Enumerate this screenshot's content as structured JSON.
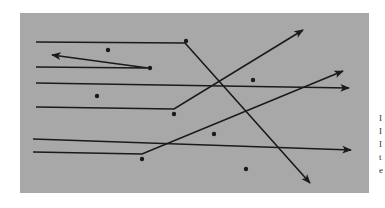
{
  "diagram": {
    "type": "trajectory-diagram",
    "panel": {
      "x": 20,
      "y": 13,
      "width": 349,
      "height": 180,
      "fill": "#a8a8a8"
    },
    "stroke_color": "#1a1a1a",
    "paths": [
      {
        "id": "path-a",
        "points": [
          [
            36,
            42
          ],
          [
            185,
            43
          ],
          [
            310,
            183
          ]
        ],
        "arrow_end": true
      },
      {
        "id": "path-b",
        "points": [
          [
            36,
            67
          ],
          [
            148,
            68
          ],
          [
            52,
            55
          ]
        ],
        "arrow_end": true
      },
      {
        "id": "path-c",
        "points": [
          [
            36,
            83
          ],
          [
            349,
            88
          ]
        ],
        "arrow_end": true
      },
      {
        "id": "path-d",
        "points": [
          [
            36,
            107
          ],
          [
            174,
            109
          ],
          [
            303,
            30
          ]
        ],
        "arrow_end": true
      },
      {
        "id": "path-e",
        "points": [
          [
            33,
            139
          ],
          [
            351,
            150
          ]
        ],
        "arrow_end": true
      },
      {
        "id": "path-f",
        "points": [
          [
            33,
            152
          ],
          [
            142,
            154
          ],
          [
            343,
            71
          ]
        ],
        "arrow_end": true
      }
    ],
    "dots": [
      [
        108,
        50
      ],
      [
        186,
        41
      ],
      [
        150,
        68
      ],
      [
        97,
        96
      ],
      [
        174,
        114
      ],
      [
        253,
        80
      ],
      [
        214,
        134
      ],
      [
        246,
        169
      ],
      [
        142,
        159
      ]
    ]
  },
  "caption_fragments": [
    "I",
    "I",
    "I",
    "t",
    "e"
  ]
}
